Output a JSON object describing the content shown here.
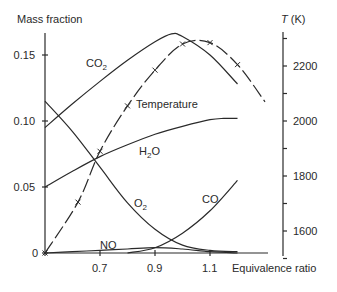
{
  "chart_data": {
    "type": "line",
    "title": "",
    "xlabel": "Equivalence ratio",
    "ylabel": "Mass fraction",
    "y2label_italic": "T",
    "y2label_unit": " (K)",
    "xlim": [
      0.5,
      1.35
    ],
    "ylim": [
      0,
      0.17
    ],
    "y2lim": [
      1500,
      2300
    ],
    "x_ticks": [
      0.7,
      0.9,
      1.1
    ],
    "x_tick_labels": [
      "0.7",
      "0.9",
      "1.1"
    ],
    "y_ticks": [
      0,
      0.05,
      0.1,
      0.15
    ],
    "y_tick_labels": [
      "0",
      "0.05",
      "0.10",
      "0.15"
    ],
    "y2_ticks": [
      1600,
      1800,
      2000,
      2200
    ],
    "y2_tick_labels": [
      "1600",
      "1800",
      "2000",
      "2200"
    ],
    "y2_minor_ticks": [
      1500,
      1700,
      1900,
      2100,
      2300
    ],
    "grid": false,
    "legend": "inline labels",
    "series": [
      {
        "name": "CO2",
        "label": "CO",
        "subscript": "2",
        "axis": "left",
        "x": [
          0.5,
          0.6,
          0.7,
          0.8,
          0.9,
          0.96,
          1.0,
          1.1,
          1.2
        ],
        "values": [
          0.095,
          0.113,
          0.13,
          0.146,
          0.16,
          0.166,
          0.164,
          0.15,
          0.128
        ]
      },
      {
        "name": "H2O",
        "label": "H",
        "subscript": "2",
        "label_suffix": "O",
        "axis": "left",
        "x": [
          0.5,
          0.6,
          0.7,
          0.8,
          0.9,
          1.0,
          1.1,
          1.15,
          1.2
        ],
        "values": [
          0.05,
          0.062,
          0.073,
          0.082,
          0.09,
          0.096,
          0.101,
          0.102,
          0.102
        ]
      },
      {
        "name": "O2",
        "label": "O",
        "subscript": "2",
        "axis": "left",
        "x": [
          0.5,
          0.6,
          0.7,
          0.8,
          0.9,
          1.0,
          1.1,
          1.2
        ],
        "values": [
          0.115,
          0.092,
          0.065,
          0.038,
          0.018,
          0.006,
          0.002,
          0.001
        ]
      },
      {
        "name": "CO",
        "label": "CO",
        "axis": "left",
        "x": [
          0.8,
          0.9,
          1.0,
          1.1,
          1.2
        ],
        "values": [
          0.0,
          0.004,
          0.015,
          0.032,
          0.055
        ]
      },
      {
        "name": "NO",
        "label": "NO",
        "axis": "left",
        "x": [
          0.5,
          0.6,
          0.7,
          0.8,
          0.9,
          1.0,
          1.1,
          1.2
        ],
        "values": [
          0.0,
          0.001,
          0.002,
          0.003,
          0.004,
          0.003,
          0.001,
          0.0
        ]
      },
      {
        "name": "Temperature",
        "label": "Temperature",
        "axis": "right",
        "markers": "x",
        "x": [
          0.5,
          0.62,
          0.7,
          0.8,
          0.9,
          1.0,
          1.1,
          1.2,
          1.3
        ],
        "values": [
          1520,
          1705,
          1890,
          2055,
          2185,
          2280,
          2285,
          2205,
          2070
        ]
      }
    ]
  }
}
